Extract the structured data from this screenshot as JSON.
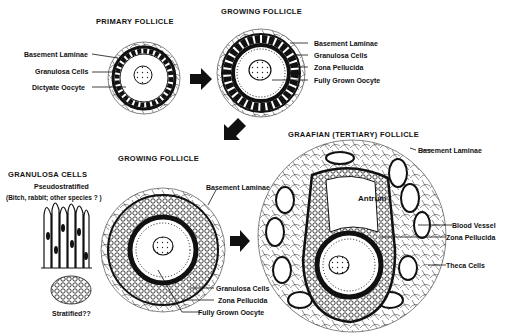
{
  "panels": {
    "primary": {
      "title": "PRIMARY FOLLICLE",
      "labels": [
        "Basement Laminae",
        "Granulosa Cells",
        "Dictyate Oocyte"
      ]
    },
    "growing_top": {
      "title": "GROWING FOLLICLE",
      "labels": [
        "Basement Laminae",
        "Granulosa Cells",
        "Zona Pellucida",
        "Fully Grown Oocyte"
      ]
    },
    "granulosa_cells": {
      "title": "GRANULOSA CELLS",
      "subtitle": "Pseudostratified",
      "note": "(Bitch, rabbit; other species ? )",
      "bottom_label": "Stratified??"
    },
    "growing_bottom": {
      "title": "GROWING FOLLICLE",
      "labels": [
        "Basement Laminae",
        "Granulosa Cells",
        "Zona Pellucida",
        "Fully Grown Oocyte"
      ]
    },
    "graafian": {
      "title": "GRAAFIAN (TERTIARY) FOLLICLE",
      "antrum_label": "Antrum",
      "labels": [
        "Basement Laminae",
        "Blood Vessel",
        "Zona Pellucida",
        "Theca Cells"
      ]
    }
  },
  "colors": {
    "ink": "#111111",
    "background": "#ffffff"
  }
}
